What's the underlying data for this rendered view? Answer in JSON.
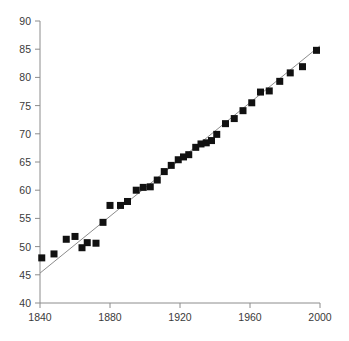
{
  "chart_data": {
    "type": "scatter",
    "title": "",
    "subtitle": "",
    "xlabel": "",
    "ylabel": "",
    "xlim": [
      1836,
      2004
    ],
    "ylim": [
      40,
      90
    ],
    "xticks": [
      1840,
      1880,
      1920,
      1960,
      2000
    ],
    "xtick_labels": [
      "1840",
      "1880",
      "1920",
      "1960",
      "2000"
    ],
    "yticks": [
      40,
      45,
      50,
      55,
      60,
      65,
      70,
      75,
      80,
      85,
      90
    ],
    "ytick_labels": [
      "40",
      "45",
      "50",
      "55",
      "60",
      "65",
      "70",
      "75",
      "80",
      "85",
      "90"
    ],
    "grid": false,
    "legend": "none",
    "marker": "square",
    "marker_color": "#111111",
    "marker_size": 7,
    "line_color": "#8c8c8c",
    "axis_color": "#8c8c8c",
    "series": [
      {
        "name": "observations",
        "x": [
          1841,
          1848,
          1855,
          1860,
          1864,
          1867,
          1872,
          1876,
          1880,
          1886,
          1890,
          1895,
          1899,
          1903,
          1907,
          1911,
          1915,
          1919,
          1922,
          1925,
          1929,
          1932,
          1935,
          1938,
          1941,
          1946,
          1951,
          1956,
          1961,
          1966,
          1971,
          1977,
          1983,
          1990,
          1998
        ],
        "y": [
          48.0,
          48.7,
          51.3,
          51.8,
          49.8,
          50.7,
          50.6,
          54.3,
          57.3,
          57.3,
          58.0,
          60.0,
          60.5,
          60.6,
          61.8,
          63.3,
          64.4,
          65.4,
          65.9,
          66.3,
          67.6,
          68.2,
          68.4,
          68.8,
          69.9,
          71.8,
          72.7,
          74.1,
          75.5,
          77.4,
          77.6,
          79.3,
          80.8,
          81.9,
          84.8
        ]
      }
    ],
    "trend_line": {
      "name": "linear-fit",
      "x": [
        1840,
        2000
      ],
      "y": [
        45.3,
        85.6
      ]
    }
  },
  "axis": {
    "x_axis_name": "x-axis",
    "y_axis_name": "y-axis"
  }
}
